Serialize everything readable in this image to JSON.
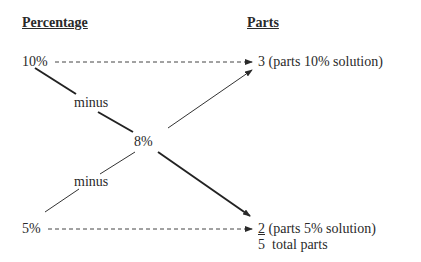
{
  "headers": {
    "percentage": "Percentage",
    "parts": "Parts"
  },
  "left": {
    "high": "10%",
    "low": "5%",
    "minus_top": "minus",
    "minus_bottom": "minus",
    "center": "8%"
  },
  "right": {
    "top_value": "3",
    "top_label": "(parts 10% solution)",
    "bottom_value": "2",
    "bottom_label": "(parts 5% solution)",
    "total_value": "5",
    "total_label": "total parts"
  }
}
